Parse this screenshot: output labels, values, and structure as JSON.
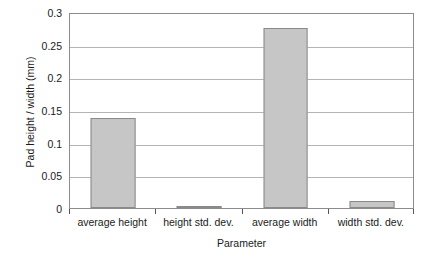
{
  "chart_data": {
    "type": "bar",
    "title": "",
    "xlabel": "Parameter",
    "ylabel": "Pad height / width (mm)",
    "categories": [
      "average height",
      "height std. dev.",
      "average width",
      "width std. dev."
    ],
    "values": [
      0.138,
      0.003,
      0.275,
      0.01
    ],
    "series": [
      {
        "name": "Pad height / width (mm)",
        "values": [
          0.138,
          0.003,
          0.275,
          0.01
        ]
      }
    ],
    "ylim": [
      0,
      0.3
    ],
    "yticks": [
      0,
      0.05,
      0.1,
      0.15,
      0.2,
      0.25,
      0.3
    ],
    "ytick_labels": [
      "0",
      "0.05",
      "0.1",
      "0.15",
      "0.2",
      "0.25",
      "0.3"
    ],
    "grid": true,
    "grid_axis": "y",
    "legend": false,
    "legend_position": "none",
    "bar_fill_color": "#c6c6c6",
    "bar_border_color": "#8a8a8a",
    "gridline_color": "#b4b4b4",
    "axis_color": "#8c8c8c",
    "background_color": "#ffffff",
    "text_color": "#1a1a1a"
  }
}
